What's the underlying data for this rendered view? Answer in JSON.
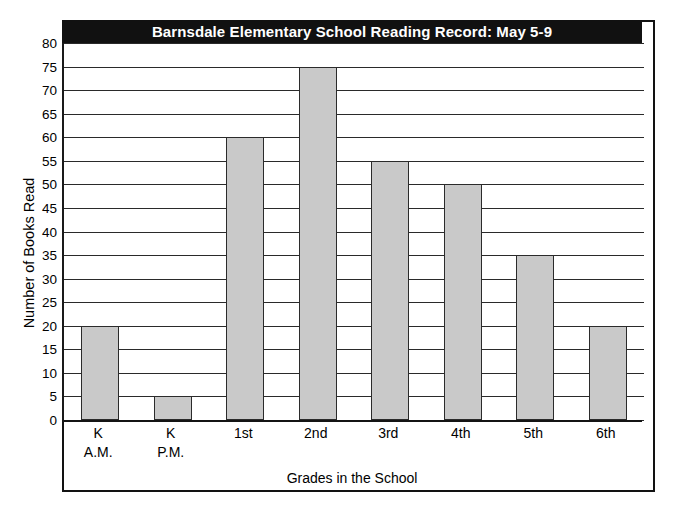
{
  "chart_data": {
    "type": "bar",
    "title": "Barnsdale Elementary School Reading Record: May 5-9",
    "xlabel": "Grades in the School",
    "ylabel": "Number of Books Read",
    "categories": [
      "K A.M.",
      "K P.M.",
      "1st",
      "2nd",
      "3rd",
      "4th",
      "5th",
      "6th"
    ],
    "category_lines": [
      [
        "K",
        "A.M."
      ],
      [
        "K",
        "P.M."
      ],
      [
        "1st",
        ""
      ],
      [
        "2nd",
        ""
      ],
      [
        "3rd",
        ""
      ],
      [
        "4th",
        ""
      ],
      [
        "5th",
        ""
      ],
      [
        "6th",
        ""
      ]
    ],
    "values": [
      20,
      5,
      60,
      75,
      55,
      50,
      35,
      20
    ],
    "ylim": [
      0,
      80
    ],
    "ytick_step": 5,
    "ytick_labels": [
      "0",
      "5",
      "10",
      "15",
      "20",
      "25",
      "30",
      "35",
      "40",
      "45",
      "50",
      "55",
      "60",
      "65",
      "70",
      "75",
      "80"
    ],
    "grid": true,
    "legend": false,
    "bar_color": "#c9c9c9",
    "bar_edge_color": "#2b2b2b",
    "title_background": "#111111",
    "title_color": "#ffffff",
    "gridline_color": "#2a2a2a",
    "frame_color": "#121212"
  }
}
